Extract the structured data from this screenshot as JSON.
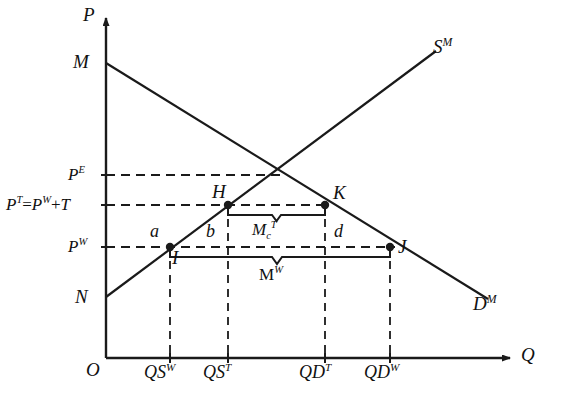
{
  "figure": {
    "type": "economics-supply-demand-tariff-diagram",
    "background": "#ffffff",
    "line_color": "#1a1a1a",
    "width": 561,
    "height": 410
  },
  "axes": {
    "y_axis_label": "P",
    "x_axis_label": "Q",
    "origin_label": "O"
  },
  "curves": {
    "demand": {
      "label": "D",
      "superscript": "M",
      "from_label": "M"
    },
    "supply": {
      "label": "S",
      "superscript": "M",
      "from_label": "N"
    },
    "demand_intercept_label": "M",
    "supply_intercept_label": "N"
  },
  "price_levels": [
    {
      "id": "pe",
      "base": "P",
      "sup": "E",
      "full": "P^E",
      "y": 175
    },
    {
      "id": "pt",
      "base": "P",
      "sup": "T",
      "full": "P^T=P^W+T",
      "y": 205,
      "parts": {
        "lhs_base": "P",
        "lhs_sup": "T",
        "eq": "=",
        "rhs_base": "P",
        "rhs_sup": "W",
        "plus": "+",
        "tax": "T"
      }
    },
    {
      "id": "pw",
      "base": "P",
      "sup": "W",
      "full": "P^W",
      "y": 247
    }
  ],
  "quantity_ticks": [
    {
      "id": "qsw",
      "base": "QS",
      "sup": "W",
      "x": 170
    },
    {
      "id": "qst",
      "base": "QS",
      "sup": "T",
      "x": 228
    },
    {
      "id": "qdt",
      "base": "QD",
      "sup": "T",
      "x": 325
    },
    {
      "id": "qdw",
      "base": "QD",
      "sup": "W",
      "x": 390
    }
  ],
  "points": [
    {
      "id": "H",
      "label": "H",
      "x": 228,
      "y": 205
    },
    {
      "id": "K",
      "label": "K",
      "x": 325,
      "y": 205
    },
    {
      "id": "I",
      "label": "I",
      "x": 170,
      "y": 247
    },
    {
      "id": "J",
      "label": "J",
      "x": 390,
      "y": 247
    }
  ],
  "areas": [
    {
      "id": "a",
      "label": "a",
      "x": 152,
      "y": 231
    },
    {
      "id": "b",
      "label": "b",
      "x": 209,
      "y": 231
    },
    {
      "id": "d",
      "label": "d",
      "x": 337,
      "y": 231
    }
  ],
  "braces": [
    {
      "id": "mct",
      "base": "M",
      "sub": "c",
      "sup": "T",
      "full": "M_c^T",
      "from_x": 228,
      "to_x": 325,
      "y": 215
    },
    {
      "id": "mw",
      "base": "M",
      "sup": "W",
      "full": "M^W",
      "from_x": 170,
      "to_x": 390,
      "y": 257
    }
  ]
}
